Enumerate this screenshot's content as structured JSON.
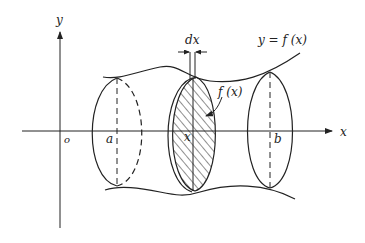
{
  "diagram": {
    "axes": {
      "x_label": "x",
      "y_label": "y",
      "origin_label": "o"
    },
    "labels": {
      "curve": "y = f (x)",
      "slice_width": "dx",
      "cross_section": "f (x)",
      "a": "a",
      "x": "x",
      "b": "b"
    },
    "colors": {
      "stroke": "#222222",
      "background": "#ffffff"
    }
  }
}
